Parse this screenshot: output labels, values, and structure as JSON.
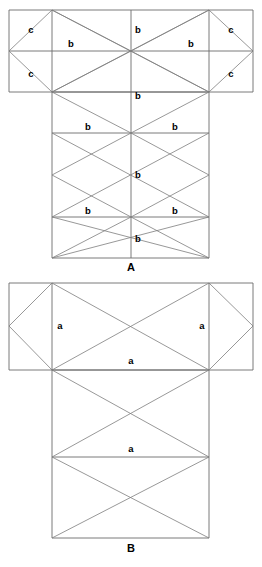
{
  "document": {
    "title": "Geometric net diagrams A and B",
    "background_color": "#ffffff",
    "line_color": "#6b6b6b",
    "label_color": "#000000"
  },
  "figures": [
    {
      "id": "figure-a",
      "caption": "A",
      "caption_position": {
        "x": 131,
        "y": 268
      },
      "description": "T-shaped net subdivided into triangles labelled b and c",
      "labels": [
        {
          "text": "c",
          "x": 31,
          "y": 30
        },
        {
          "text": "b",
          "x": 71,
          "y": 44
        },
        {
          "text": "b",
          "x": 138,
          "y": 30
        },
        {
          "text": "b",
          "x": 191,
          "y": 44
        },
        {
          "text": "c",
          "x": 231,
          "y": 30
        },
        {
          "text": "c",
          "x": 31,
          "y": 74
        },
        {
          "text": "c",
          "x": 231,
          "y": 74
        },
        {
          "text": "b",
          "x": 138,
          "y": 96
        },
        {
          "text": "b",
          "x": 88,
          "y": 127
        },
        {
          "text": "b",
          "x": 175,
          "y": 127
        },
        {
          "text": "b",
          "x": 138,
          "y": 175
        },
        {
          "text": "b",
          "x": 88,
          "y": 211
        },
        {
          "text": "b",
          "x": 175,
          "y": 211
        },
        {
          "text": "b",
          "x": 138,
          "y": 239
        }
      ]
    },
    {
      "id": "figure-b",
      "caption": "B",
      "caption_position": {
        "x": 131,
        "y": 549
      },
      "description": "T-shaped net subdivided into triangles labelled a",
      "labels": [
        {
          "text": "a",
          "x": 60,
          "y": 326
        },
        {
          "text": "a",
          "x": 202,
          "y": 326
        },
        {
          "text": "a",
          "x": 131,
          "y": 361
        },
        {
          "text": "a",
          "x": 131,
          "y": 449
        }
      ]
    }
  ],
  "geometry": {
    "figure_a": {
      "top_rect": {
        "left": 9,
        "right": 253,
        "top": 10,
        "bottom": 92
      },
      "mid_y": 51,
      "body": {
        "left": 52,
        "right": 209,
        "top": 92,
        "bottom": 258
      },
      "body_rows": [
        92,
        133,
        175,
        217,
        258
      ],
      "center_x": 131
    },
    "figure_b": {
      "top_rect": {
        "left": 9,
        "right": 253,
        "top": 283,
        "bottom": 370
      },
      "mid_y": 326,
      "body": {
        "left": 52,
        "right": 209,
        "top": 370,
        "bottom": 538
      },
      "body_rows": [
        370,
        457,
        538
      ],
      "center_x": 131
    }
  }
}
